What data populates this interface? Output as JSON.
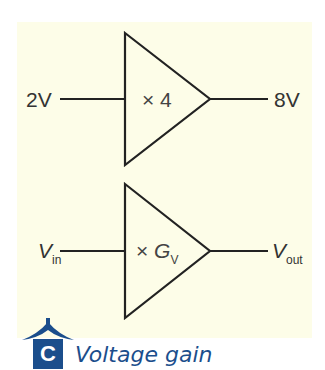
{
  "panel": {
    "background": "#fdfde8"
  },
  "amplifiers": [
    {
      "input_label": "2V",
      "gain_label": "× 4",
      "output_label": "8V"
    },
    {
      "input_label": "V",
      "input_sub": "in",
      "gain_prefix": "×",
      "gain_symbol": "G",
      "gain_sub": "V",
      "output_label": "V",
      "output_sub": "out"
    }
  ],
  "caption": {
    "badge": "C",
    "text": "Voltage gain",
    "color": "#1b4e8c"
  }
}
